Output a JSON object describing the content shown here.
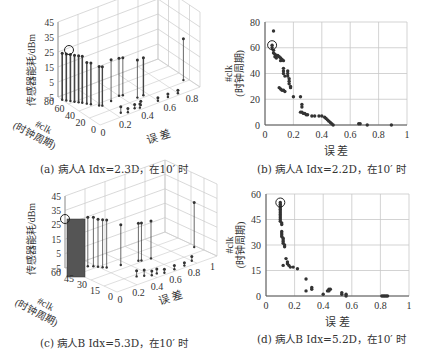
{
  "chart_data": [
    {
      "id": "a",
      "type": "3d-stem",
      "caption": "(a) 病人A Idx=2.3D，在10′ 时",
      "zlabel": "传感器能耗/dBm",
      "zticks": [
        "45",
        "35",
        "25",
        "15",
        "5",
        "−5"
      ],
      "ylabel_line1": "#clk",
      "ylabel_line2": "(时钟周期)",
      "yticks": [
        "80",
        "60",
        "40",
        "20",
        "0"
      ],
      "xlabel": "误 差",
      "xticks": [
        "0",
        "0.2",
        "0.4",
        "0.6",
        "0.8"
      ],
      "highlight": {
        "error": 0.05,
        "clk": 62,
        "power": 31
      },
      "stems_note": "dense stems at low error (0-0.15) ~27-31 dBm, mid stems ~25 dBm at 0.2-0.45, single stem ~27 dBm at 0.88"
    },
    {
      "id": "b",
      "type": "scatter",
      "caption": "(b) 病人A Idx=2.2D，在10′ 时",
      "xlabel": "误 差",
      "ylabel_line1": "#clk",
      "ylabel_line2": "(时钟周期)",
      "xticks": [
        "0",
        "0.2",
        "0.4",
        "0.6",
        "0.8",
        "1"
      ],
      "yticks": [
        "0",
        "20",
        "40",
        "60",
        "80"
      ],
      "xlim": [
        0,
        1
      ],
      "ylim": [
        0,
        80
      ],
      "highlight": {
        "x": 0.05,
        "y": 62
      },
      "points": [
        [
          0.06,
          73
        ],
        [
          0.05,
          62
        ],
        [
          0.05,
          60
        ],
        [
          0.06,
          58
        ],
        [
          0.06,
          56
        ],
        [
          0.07,
          55
        ],
        [
          0.08,
          54
        ],
        [
          0.09,
          54
        ],
        [
          0.07,
          53
        ],
        [
          0.08,
          52
        ],
        [
          0.1,
          53
        ],
        [
          0.11,
          52
        ],
        [
          0.12,
          51
        ],
        [
          0.11,
          50
        ],
        [
          0.13,
          50
        ],
        [
          0.13,
          44
        ],
        [
          0.13,
          42
        ],
        [
          0.13,
          40
        ],
        [
          0.14,
          38
        ],
        [
          0.16,
          42
        ],
        [
          0.16,
          40
        ],
        [
          0.16,
          38
        ],
        [
          0.17,
          36
        ],
        [
          0.17,
          34
        ],
        [
          0.17,
          32
        ],
        [
          0.18,
          30
        ],
        [
          0.18,
          29
        ],
        [
          0.1,
          29
        ],
        [
          0.11,
          28
        ],
        [
          0.12,
          27
        ],
        [
          0.13,
          27
        ],
        [
          0.14,
          26
        ],
        [
          0.2,
          22
        ],
        [
          0.25,
          22
        ],
        [
          0.26,
          16
        ],
        [
          0.26,
          14
        ],
        [
          0.25,
          10
        ],
        [
          0.26,
          10
        ],
        [
          0.27,
          9
        ],
        [
          0.28,
          9
        ],
        [
          0.29,
          8
        ],
        [
          0.3,
          8
        ],
        [
          0.33,
          7
        ],
        [
          0.35,
          7
        ],
        [
          0.38,
          7
        ],
        [
          0.4,
          7
        ],
        [
          0.42,
          6
        ],
        [
          0.43,
          5
        ],
        [
          0.44,
          4
        ],
        [
          0.45,
          3
        ],
        [
          0.46,
          2
        ],
        [
          0.47,
          1
        ],
        [
          0.48,
          0
        ],
        [
          0.66,
          1
        ],
        [
          0.67,
          1
        ],
        [
          0.72,
          0
        ],
        [
          0.89,
          0
        ]
      ]
    },
    {
      "id": "c",
      "type": "3d-stem",
      "caption": "(c) 病人B Idx=5.3D，在10′ 时",
      "zlabel": "传感器能耗/dBm",
      "zticks": [
        "45",
        "35",
        "25",
        "15",
        "5",
        "−5"
      ],
      "ylabel_line1": "#clk",
      "ylabel_line2": "(时钟周期)",
      "yticks": [
        "60",
        "45",
        "30",
        "15",
        "0"
      ],
      "xlabel": "误 差",
      "xticks": [
        "0",
        "0.2",
        "0.4",
        "0.6",
        "0.8",
        "1"
      ],
      "highlight": {
        "error": 0.09,
        "clk": 55,
        "power": 34
      },
      "stems_note": "dense stems at error ~0.1 at ~33 dBm, stems ~30 dBm at 0.15-0.2, stems ~25 dBm at 0.28, 0.52-0.56, tallest outlier ~31 dBm at 0.82"
    },
    {
      "id": "d",
      "type": "scatter",
      "caption": "(d) 病人B Idx=5.2D，在10′ 时",
      "xlabel": "误 差",
      "ylabel_line1": "#clk",
      "ylabel_line2": "(时钟周期)",
      "xticks": [
        "0",
        "0.2",
        "0.4",
        "0.6",
        "0.8",
        "1"
      ],
      "yticks": [
        "0",
        "15",
        "30",
        "45",
        "60"
      ],
      "xlim": [
        0,
        1
      ],
      "ylim": [
        0,
        60
      ],
      "highlight": {
        "x": 0.1,
        "y": 55
      },
      "points": [
        [
          0.1,
          55
        ],
        [
          0.1,
          54
        ],
        [
          0.1,
          53
        ],
        [
          0.1,
          52
        ],
        [
          0.1,
          51
        ],
        [
          0.1,
          50
        ],
        [
          0.1,
          49
        ],
        [
          0.1,
          48
        ],
        [
          0.1,
          47
        ],
        [
          0.1,
          46
        ],
        [
          0.1,
          45
        ],
        [
          0.1,
          44
        ],
        [
          0.11,
          43
        ],
        [
          0.11,
          42
        ],
        [
          0.11,
          38
        ],
        [
          0.11,
          37
        ],
        [
          0.11,
          36
        ],
        [
          0.11,
          35
        ],
        [
          0.12,
          34
        ],
        [
          0.12,
          33
        ],
        [
          0.12,
          32
        ],
        [
          0.12,
          31
        ],
        [
          0.13,
          30
        ],
        [
          0.13,
          29
        ],
        [
          0.14,
          22
        ],
        [
          0.15,
          20
        ],
        [
          0.15,
          19
        ],
        [
          0.16,
          18
        ],
        [
          0.12,
          18
        ],
        [
          0.17,
          17
        ],
        [
          0.19,
          17
        ],
        [
          0.22,
          16
        ],
        [
          0.28,
          10
        ],
        [
          0.28,
          3
        ],
        [
          0.32,
          4
        ],
        [
          0.32,
          5
        ],
        [
          0.4,
          1
        ],
        [
          0.43,
          3
        ],
        [
          0.44,
          4
        ],
        [
          0.45,
          4
        ],
        [
          0.44,
          3
        ],
        [
          0.53,
          2
        ],
        [
          0.53,
          1
        ],
        [
          0.56,
          1
        ],
        [
          0.56,
          0
        ],
        [
          0.81,
          0
        ],
        [
          0.82,
          0
        ],
        [
          0.83,
          0
        ],
        [
          0.84,
          0
        ],
        [
          0.85,
          0
        ]
      ]
    }
  ]
}
